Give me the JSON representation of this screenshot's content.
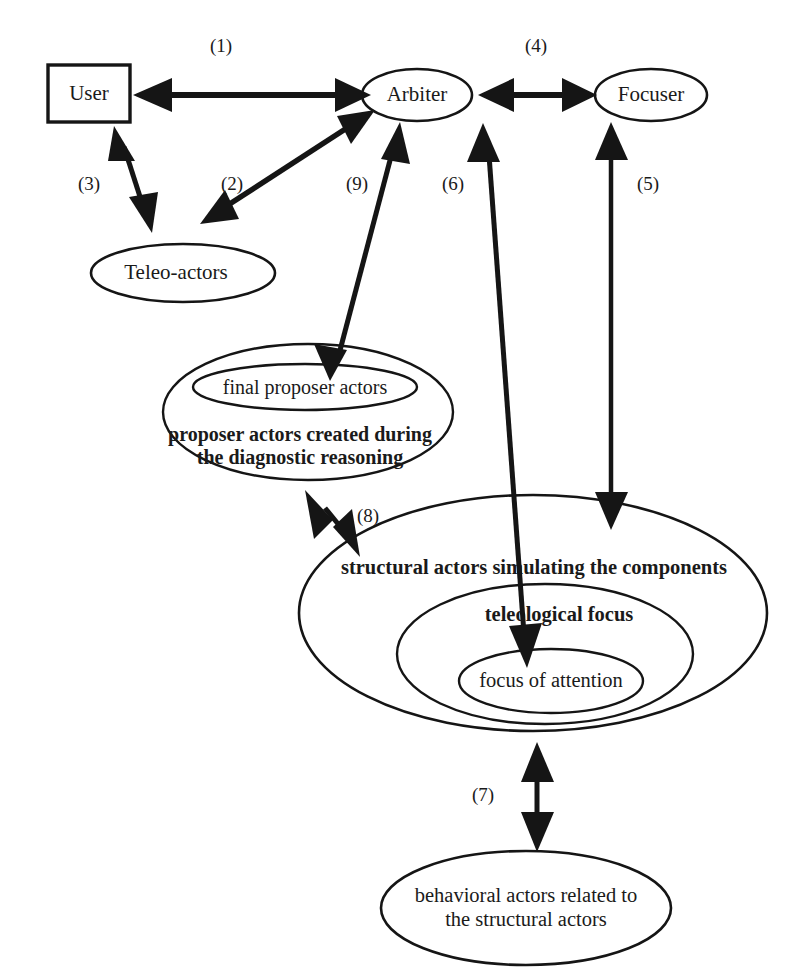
{
  "diagram": {
    "background_color": "#ffffff",
    "ink_color": "#151515",
    "nodes": [
      {
        "id": "user",
        "label": "User",
        "shape": "rectangle"
      },
      {
        "id": "arbiter",
        "label": "Arbiter",
        "shape": "ellipse"
      },
      {
        "id": "focuser",
        "label": "Focuser",
        "shape": "ellipse"
      },
      {
        "id": "teleo_actors",
        "label": "Teleo-actors",
        "shape": "ellipse"
      },
      {
        "id": "final_proposer",
        "label": "final proposer actors",
        "shape": "ellipse"
      },
      {
        "id": "proposer_line1",
        "label": "proposer actors created during",
        "shape": "text"
      },
      {
        "id": "proposer_line2",
        "label": "the diagnostic reasoning",
        "shape": "text"
      },
      {
        "id": "structural_actors",
        "label": "structural  actors simulating the components",
        "shape": "ellipse"
      },
      {
        "id": "teleological_focus",
        "label": "teleological focus",
        "shape": "ellipse"
      },
      {
        "id": "focus_of_attention",
        "label": "focus of attention",
        "shape": "ellipse"
      },
      {
        "id": "behavioral_line1",
        "label": "behavioral actors related to",
        "shape": "ellipse"
      },
      {
        "id": "behavioral_line2",
        "label": "the structural actors",
        "shape": "text"
      }
    ],
    "edges": [
      {
        "id": "e1",
        "label": "(1)",
        "from": "user",
        "to": "arbiter",
        "direction": "bidirectional"
      },
      {
        "id": "e2",
        "label": "(2)",
        "from": "arbiter",
        "to": "teleo-actors-area",
        "direction": "bidirectional"
      },
      {
        "id": "e3",
        "label": "(3)",
        "from": "user",
        "to": "teleo_actors",
        "direction": "bidirectional"
      },
      {
        "id": "e4",
        "label": "(4)",
        "from": "arbiter",
        "to": "focuser",
        "direction": "bidirectional"
      },
      {
        "id": "e5",
        "label": "(5)",
        "from": "focuser",
        "to": "structural_actors",
        "direction": "bidirectional"
      },
      {
        "id": "e6",
        "label": "(6)",
        "from": "arbiter",
        "to": "focus_of_attention",
        "direction": "bidirectional"
      },
      {
        "id": "e7",
        "label": "(7)",
        "from": "structural_actors",
        "to": "behavioral_actors",
        "direction": "bidirectional"
      },
      {
        "id": "e8",
        "label": "(8)",
        "from": "proposer_actors",
        "to": "structural_actors",
        "direction": "bidirectional"
      },
      {
        "id": "e9",
        "label": "(9)",
        "from": "arbiter",
        "to": "final_proposer",
        "direction": "bidirectional"
      }
    ]
  }
}
